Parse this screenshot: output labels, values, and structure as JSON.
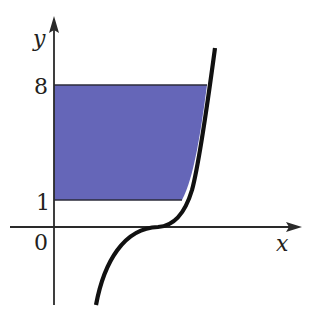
{
  "figure": {
    "type": "cubic-curve-region",
    "axes": {
      "x_label": "x",
      "y_label": "y",
      "origin_label": "0"
    },
    "y_ticks": [
      {
        "label": "8",
        "value": 8
      },
      {
        "label": "1",
        "value": 1
      }
    ],
    "region": {
      "description": "Region between y=1 and y=8 bounded by the y-axis and the curve",
      "fill_color": "#6566b8",
      "edge_color": "#2b2b3a"
    },
    "curve": {
      "description": "Cubic-shaped curve passing through inflection point on x-axis",
      "color": "#111111"
    },
    "axis_color": "#2a2a2a"
  }
}
